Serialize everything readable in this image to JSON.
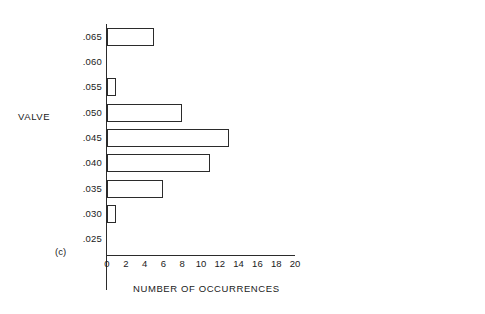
{
  "chart_data": {
    "type": "bar",
    "orientation": "horizontal",
    "title": "",
    "xlabel": "NUMBER OF OCCURRENCES",
    "ylabel": "VALVE",
    "panel_label": "(c)",
    "categories": [
      ".065",
      ".060",
      ".055",
      ".050",
      ".045",
      ".040",
      ".035",
      ".030",
      ".025"
    ],
    "values": [
      5,
      0,
      1,
      8,
      13,
      11,
      6,
      1,
      0
    ],
    "xlim": [
      0,
      20
    ],
    "ylim": [
      ".025",
      ".065"
    ],
    "xticks": [
      0,
      2,
      4,
      6,
      8,
      10,
      12,
      14,
      16,
      18,
      20
    ],
    "xtick_labels": [
      "0",
      "2",
      "4",
      "6",
      "8",
      "10",
      "12",
      "14",
      "16",
      "18",
      "20"
    ],
    "ytick_labels": [
      ".065",
      ".060",
      ".055",
      ".050",
      ".045",
      ".040",
      ".035",
      ".030",
      ".025"
    ],
    "grid": false,
    "legend": null,
    "bar_fill_color": "#ffffff",
    "bar_edge_color": "#2b2b2b",
    "axis_color": "#2b2b2b",
    "background_color": "#ffffff",
    "bars": [
      {
        "category": ".065",
        "value": 5
      },
      {
        "category": ".060",
        "value": 0
      },
      {
        "category": ".055",
        "value": 1
      },
      {
        "category": ".050",
        "value": 8
      },
      {
        "category": ".045",
        "value": 13
      },
      {
        "category": ".040",
        "value": 11
      },
      {
        "category": ".035",
        "value": 6
      },
      {
        "category": ".030",
        "value": 1
      },
      {
        "category": ".025",
        "value": 0
      }
    ]
  }
}
